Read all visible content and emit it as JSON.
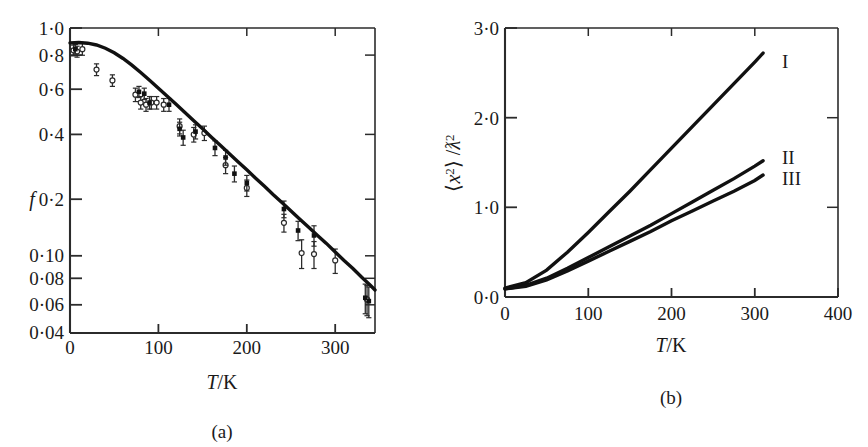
{
  "figure": {
    "panels": [
      {
        "id": "a",
        "caption": "(a)",
        "ylabel": "f",
        "ylabel_italic": true,
        "xlabel_parts": {
          "symbol": "T",
          "rest": "/K"
        },
        "xlabel": "T/K",
        "yticks": [
          "1·0",
          "0·8",
          "0·6",
          "0·4",
          "0·2",
          "0·10",
          "0·08",
          "0·06",
          "0·04"
        ],
        "ytick_values": [
          1.0,
          0.8,
          0.6,
          0.4,
          0.2,
          0.1,
          0.08,
          0.06,
          0.04
        ],
        "xticks": [
          "0",
          "100",
          "200",
          "300"
        ],
        "xtick_values": [
          0,
          100,
          200,
          300
        ]
      },
      {
        "id": "b",
        "caption": "(b)",
        "ylabel": "⟨x²⟩ /ƛ²",
        "ylabel_parts": {
          "open": "⟨",
          "symbol": "x",
          "sup": "2",
          "close": "⟩",
          "slash": " /",
          "denom": "ƛ",
          "denom_sup": "2"
        },
        "xlabel_parts": {
          "symbol": "T",
          "rest": "/K"
        },
        "xlabel": "T/K",
        "yticks": [
          "3·0",
          "2·0",
          "1·0",
          "0·0"
        ],
        "ytick_values": [
          3.0,
          2.0,
          1.0,
          0.0
        ],
        "xticks": [
          "0",
          "100",
          "200",
          "300",
          "400"
        ],
        "xtick_values": [
          0,
          100,
          200,
          300,
          400
        ],
        "curve_labels": [
          "I",
          "II",
          "III"
        ]
      }
    ],
    "colors": {
      "ink": "#1a1a1a",
      "axis": "#3a3a3a",
      "curve": "#111111",
      "marker_open": "#ffffff"
    }
  },
  "chart_data": [
    {
      "type": "scatter",
      "panel": "a",
      "title": "",
      "xlabel": "T/K",
      "ylabel": "f",
      "xlim": [
        0,
        345
      ],
      "ylim": [
        0.04,
        1.0
      ],
      "yscale": "log",
      "grid": false,
      "legend": "none",
      "series": [
        {
          "name": "model fit curve",
          "type": "line",
          "x": [
            0,
            10,
            20,
            30,
            40,
            50,
            60,
            70,
            80,
            90,
            100,
            110,
            120,
            130,
            140,
            150,
            160,
            170,
            180,
            190,
            200,
            210,
            220,
            230,
            240,
            250,
            260,
            270,
            280,
            290,
            300,
            310,
            320,
            330,
            340,
            345
          ],
          "y": [
            0.855,
            0.858,
            0.852,
            0.836,
            0.808,
            0.77,
            0.725,
            0.676,
            0.625,
            0.576,
            0.53,
            0.487,
            0.447,
            0.41,
            0.376,
            0.345,
            0.316,
            0.29,
            0.266,
            0.244,
            0.224,
            0.205,
            0.188,
            0.172,
            0.158,
            0.145,
            0.133,
            0.122,
            0.112,
            0.103,
            0.094,
            0.086,
            0.079,
            0.072,
            0.066,
            0.063
          ]
        },
        {
          "name": "measured recoilless fraction (open symbols)",
          "type": "scatter",
          "marker": "open-circle",
          "x": [
            4,
            8,
            14,
            30,
            48,
            74,
            80,
            86,
            92,
            98,
            106,
            124,
            140,
            152,
            176,
            200,
            242,
            262,
            276,
            300,
            336
          ],
          "y": [
            0.79,
            0.78,
            0.8,
            0.645,
            0.575,
            0.495,
            0.455,
            0.445,
            0.455,
            0.455,
            0.445,
            0.355,
            0.325,
            0.33,
            0.235,
            0.185,
            0.128,
            0.093,
            0.092,
            0.086,
            0.057
          ],
          "yerr": [
            0.045,
            0.045,
            0.05,
            0.04,
            0.035,
            0.035,
            0.03,
            0.03,
            0.03,
            0.03,
            0.03,
            0.028,
            0.025,
            0.025,
            0.02,
            0.016,
            0.012,
            0.014,
            0.013,
            0.011,
            0.009
          ]
        },
        {
          "name": "measured recoilless fraction (filled symbols)",
          "type": "scatter",
          "marker": "filled-square",
          "x": [
            6,
            78,
            84,
            90,
            112,
            124,
            128,
            142,
            164,
            176,
            186,
            200,
            242,
            258,
            276,
            334,
            338
          ],
          "y": [
            0.8,
            0.51,
            0.5,
            0.455,
            0.445,
            0.345,
            0.315,
            0.335,
            0.282,
            0.255,
            0.215,
            0.195,
            0.148,
            0.118,
            0.112,
            0.058,
            0.056
          ],
          "yerr": [
            0.04,
            0.03,
            0.03,
            0.03,
            0.03,
            0.025,
            0.025,
            0.025,
            0.022,
            0.02,
            0.018,
            0.016,
            0.013,
            0.012,
            0.012,
            0.009,
            0.009
          ]
        }
      ]
    },
    {
      "type": "line",
      "panel": "b",
      "title": "",
      "xlabel": "T/K",
      "ylabel": "⟨x²⟩ /ƛ²",
      "xlim": [
        0,
        400
      ],
      "ylim": [
        0.0,
        3.0
      ],
      "grid": false,
      "legend": "inline-right",
      "x": [
        0,
        25,
        50,
        75,
        100,
        125,
        150,
        175,
        200,
        225,
        250,
        275,
        300,
        310
      ],
      "series": [
        {
          "name": "I",
          "values": [
            0.1,
            0.16,
            0.3,
            0.5,
            0.72,
            0.95,
            1.18,
            1.42,
            1.66,
            1.9,
            2.14,
            2.38,
            2.62,
            2.72
          ]
        },
        {
          "name": "II",
          "values": [
            0.09,
            0.13,
            0.21,
            0.32,
            0.44,
            0.56,
            0.68,
            0.8,
            0.93,
            1.06,
            1.19,
            1.32,
            1.46,
            1.52
          ]
        },
        {
          "name": "III",
          "values": [
            0.09,
            0.12,
            0.19,
            0.29,
            0.4,
            0.51,
            0.62,
            0.73,
            0.85,
            0.96,
            1.07,
            1.18,
            1.3,
            1.36
          ]
        }
      ]
    }
  ]
}
